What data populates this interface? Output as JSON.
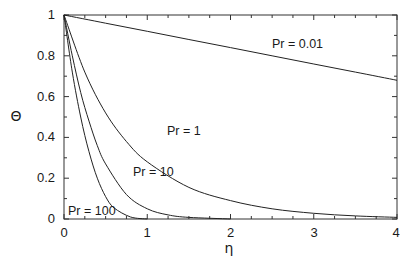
{
  "chart_data": {
    "type": "line",
    "title": "",
    "xlabel": "η",
    "ylabel": "Θ",
    "xlim": [
      0,
      4
    ],
    "ylim": [
      0,
      1
    ],
    "grid": false,
    "legend_position": "inline curve labels",
    "xticks": [
      "0",
      "1",
      "2",
      "3",
      "4"
    ],
    "yticks": [
      "0",
      "0.2",
      "0.4",
      "0.6",
      "0.8",
      "1"
    ],
    "series": [
      {
        "name": "Pr = 0.01",
        "x": [
          0,
          0.5,
          1,
          1.5,
          2,
          2.5,
          3,
          3.5,
          4
        ],
        "y": [
          1.0,
          0.96,
          0.92,
          0.88,
          0.84,
          0.8,
          0.76,
          0.72,
          0.68
        ]
      },
      {
        "name": "Pr = 1",
        "x": [
          0,
          0.25,
          0.5,
          0.75,
          1,
          1.5,
          2,
          2.5,
          3,
          3.5,
          4
        ],
        "y": [
          1.0,
          0.72,
          0.52,
          0.38,
          0.28,
          0.155,
          0.09,
          0.05,
          0.028,
          0.015,
          0.008
        ]
      },
      {
        "name": "Pr = 10",
        "x": [
          0,
          0.1,
          0.2,
          0.3,
          0.4,
          0.5,
          0.75,
          1,
          1.25,
          1.5,
          2
        ],
        "y": [
          1.0,
          0.8,
          0.62,
          0.48,
          0.36,
          0.27,
          0.12,
          0.05,
          0.02,
          0.008,
          0.0
        ]
      },
      {
        "name": "Pr = 100",
        "x": [
          0,
          0.1,
          0.2,
          0.3,
          0.4,
          0.5,
          0.6,
          0.8,
          1.0
        ],
        "y": [
          1.0,
          0.72,
          0.5,
          0.33,
          0.2,
          0.11,
          0.055,
          0.01,
          0.0
        ]
      }
    ],
    "annotations": [
      {
        "text": "Pr = 0.01",
        "x": 2.95,
        "y": 0.87
      },
      {
        "text": "Pr = 1",
        "x": 1.27,
        "y": 0.43
      },
      {
        "text": "Pr = 10",
        "x": 0.85,
        "y": 0.23
      },
      {
        "text": "Pr = 100",
        "x": 0.08,
        "y": 0.05
      }
    ]
  },
  "labels": {
    "x_axis": "η",
    "y_axis": "Θ",
    "curve_001": "Pr = 0.01",
    "curve_1": "Pr = 1",
    "curve_10": "Pr = 10",
    "curve_100": "Pr = 100",
    "xt0": "0",
    "xt1": "1",
    "xt2": "2",
    "xt3": "3",
    "xt4": "4",
    "yt0": "0",
    "yt1": "0.2",
    "yt2": "0.4",
    "yt3": "0.6",
    "yt4": "0.8",
    "yt5": "1"
  }
}
